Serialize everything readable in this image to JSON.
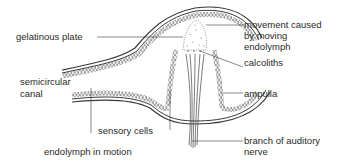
{
  "diagram": {
    "labels": {
      "gelatinous_plate": "gelatinous plate",
      "movement_line1": "movement caused",
      "movement_line2": "by moving",
      "movement_line3": "endolymph",
      "calcoliths": "calcoliths",
      "semicircular_line1": "semicircular",
      "semicircular_line2": "canal",
      "ampulla": "ampulla",
      "sensory_cells": "sensory cells",
      "endolymph_motion": "endolymph in motion",
      "branch_line1": "branch of auditory",
      "branch_line2": "nerve"
    },
    "colors": {
      "line": "#3a3a3a",
      "text": "#2a2a2a",
      "background": "#ffffff"
    }
  }
}
